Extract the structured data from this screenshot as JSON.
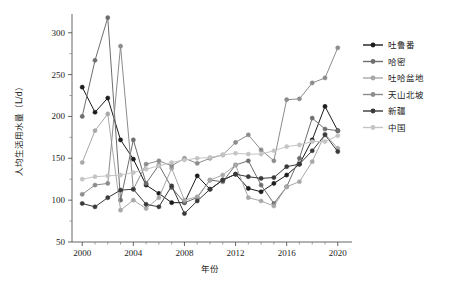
{
  "chart_data": {
    "type": "line",
    "title": "",
    "xlabel": "年份",
    "ylabel": "人均生活用水量（L/d）",
    "xlim": [
      1999.2,
      2020.8
    ],
    "ylim": [
      50,
      320
    ],
    "xticks": [
      2000,
      2004,
      2008,
      2012,
      2016,
      2020
    ],
    "xticklabels": [
      "2000",
      "2004",
      "2008",
      "2012",
      "2016",
      "2020"
    ],
    "yticks": [
      50,
      100,
      150,
      200,
      250,
      300
    ],
    "yticklabels": [
      "50",
      "100",
      "150",
      "200",
      "250",
      "300"
    ],
    "yminorticks": [
      75,
      125,
      175,
      225,
      275
    ],
    "grid": false,
    "legend_position": "right",
    "x": [
      2000,
      2001,
      2002,
      2003,
      2004,
      2005,
      2006,
      2007,
      2008,
      2009,
      2010,
      2011,
      2012,
      2013,
      2014,
      2015,
      2016,
      2017,
      2018,
      2019,
      2020
    ],
    "series": [
      {
        "name": "吐鲁番",
        "color": "#1c1c1c",
        "marker": "circle",
        "values": [
          235,
          205,
          222,
          172,
          149,
          118,
          108,
          97,
          97,
          129,
          113,
          124,
          131,
          114,
          110,
          120,
          130,
          143,
          172,
          212,
          183
        ]
      },
      {
        "name": "哈密",
        "color": "#6e6e6e",
        "marker": "circle",
        "values": [
          200,
          267,
          318,
          100,
          172,
          120,
          142,
          115,
          97,
          103,
          124,
          122,
          142,
          147,
          118,
          96,
          116,
          150,
          198,
          185,
          183
        ]
      },
      {
        "name": "吐哈盆地",
        "color": "#a8a8a8",
        "marker": "circle",
        "values": [
          145,
          183,
          203,
          88,
          100,
          90,
          103,
          138,
          100,
          104,
          124,
          130,
          142,
          103,
          99,
          93,
          116,
          122,
          146,
          179,
          162
        ]
      },
      {
        "name": "天山北坡",
        "color": "#8c8c8c",
        "marker": "circle",
        "values": [
          107,
          118,
          120,
          284,
          113,
          143,
          147,
          141,
          150,
          144,
          150,
          154,
          169,
          178,
          160,
          147,
          220,
          221,
          240,
          246,
          282
        ]
      },
      {
        "name": "新疆",
        "color": "#3a3a3a",
        "marker": "circle",
        "values": [
          96,
          92,
          103,
          112,
          113,
          95,
          92,
          117,
          84,
          99,
          113,
          124,
          131,
          128,
          126,
          127,
          140,
          143,
          159,
          178,
          158
        ]
      },
      {
        "name": "中国",
        "color": "#c4c4c4",
        "marker": "circle",
        "values": [
          125,
          128,
          129,
          130,
          133,
          137,
          141,
          145,
          148,
          150,
          151,
          154,
          156,
          155,
          155,
          159,
          164,
          166,
          170,
          170,
          177
        ]
      }
    ]
  },
  "caption": "",
  "legend": {
    "items": [
      {
        "label": "吐鲁番",
        "color": "#1c1c1c"
      },
      {
        "label": "哈密",
        "color": "#6e6e6e"
      },
      {
        "label": "吐哈盆地",
        "color": "#a8a8a8"
      },
      {
        "label": "天山北坡",
        "color": "#8c8c8c"
      },
      {
        "label": "新疆",
        "color": "#3a3a3a"
      },
      {
        "label": "中国",
        "color": "#c4c4c4"
      }
    ]
  }
}
